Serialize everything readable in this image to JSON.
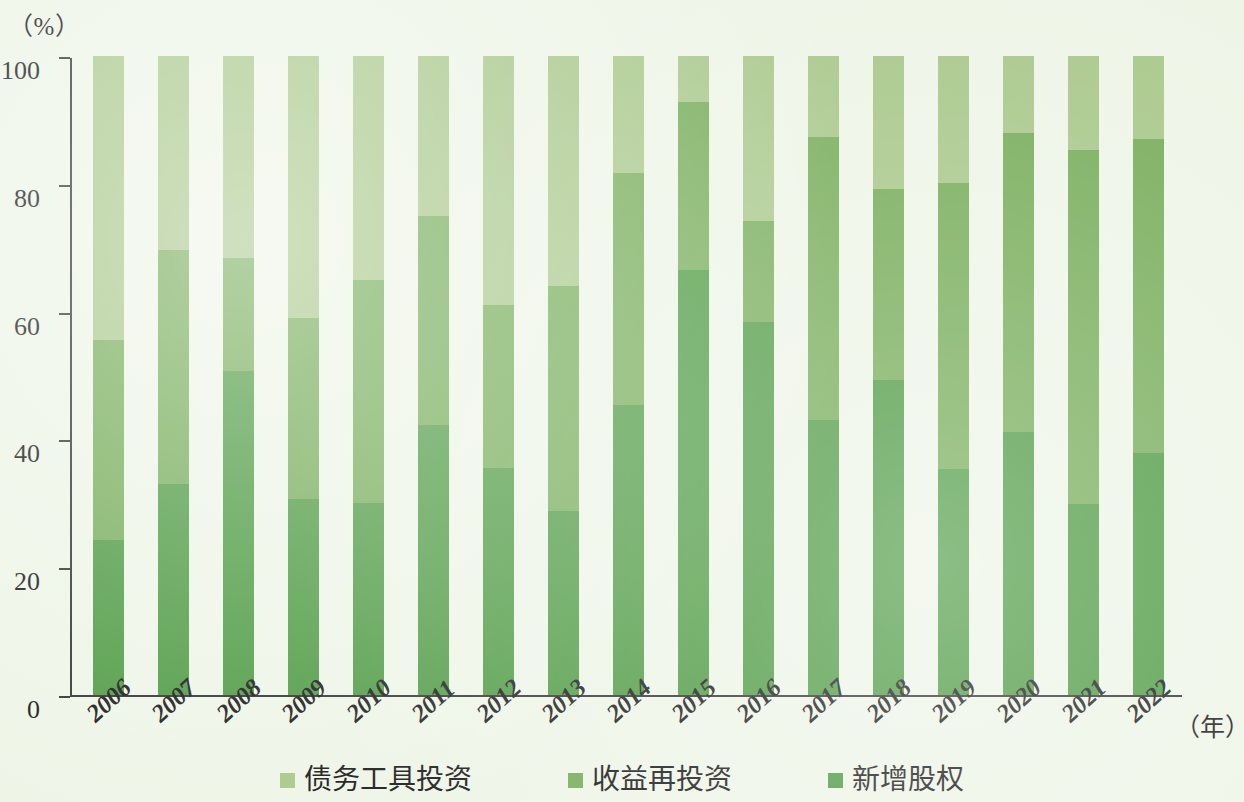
{
  "axes": {
    "y_unit": "（%）",
    "x_unit": "（年）",
    "y_ticks": [
      "0",
      "20",
      "40",
      "60",
      "80",
      "100"
    ]
  },
  "legend": {
    "items": [
      {
        "label": "债务工具投资",
        "color": "#a9c88b",
        "key": "debt"
      },
      {
        "label": "收益再投资",
        "color": "#77ad5a",
        "key": "reinvested"
      },
      {
        "label": "新增股权",
        "color": "#4f9b44",
        "key": "equity"
      }
    ]
  },
  "chart_data": {
    "type": "bar",
    "stacked": true,
    "stack_total": 100,
    "title": "",
    "subtitle": "",
    "xlabel": "（年）",
    "ylabel": "（%）",
    "ylim": [
      0,
      100
    ],
    "yticks": [
      0,
      20,
      40,
      60,
      80,
      100
    ],
    "grid": false,
    "legend_position": "bottom",
    "categories": [
      "2006",
      "2007",
      "2008",
      "2009",
      "2010",
      "2011",
      "2012",
      "2013",
      "2014",
      "2015",
      "2016",
      "2017",
      "2018",
      "2019",
      "2020",
      "2021",
      "2022"
    ],
    "series": [
      {
        "name": "新增股权",
        "color": "#4f9b44",
        "values": [
          24.3,
          33.0,
          50.7,
          30.6,
          30.1,
          42.2,
          35.6,
          28.8,
          45.4,
          66.5,
          58.4,
          43.0,
          49.3,
          35.3,
          41.1,
          29.9,
          37.8
        ]
      },
      {
        "name": "收益再投资",
        "color": "#77ad5a",
        "values": [
          31.3,
          36.7,
          17.7,
          28.4,
          34.8,
          32.7,
          25.4,
          35.2,
          36.3,
          26.3,
          15.8,
          44.4,
          29.9,
          44.8,
          46.8,
          55.4,
          49.2
        ]
      },
      {
        "name": "债务工具投资",
        "color": "#a9c88b",
        "values": [
          44.4,
          30.3,
          31.6,
          41.0,
          35.1,
          25.1,
          39.0,
          36.0,
          18.3,
          7.2,
          25.8,
          12.6,
          20.8,
          19.9,
          12.1,
          14.7,
          13.0
        ]
      }
    ],
    "cumulative_tops": {
      "新增股权": [
        24.3,
        33.0,
        50.7,
        30.6,
        30.1,
        42.2,
        35.6,
        28.8,
        45.4,
        66.5,
        58.4,
        43.0,
        49.3,
        35.3,
        41.1,
        29.9,
        37.8
      ],
      "收益再投资": [
        55.6,
        69.7,
        68.4,
        59.0,
        64.9,
        74.9,
        61.0,
        64.0,
        81.7,
        92.8,
        74.2,
        87.4,
        79.2,
        80.1,
        87.9,
        85.3,
        87.0
      ],
      "债务工具投资": [
        100,
        100,
        100,
        100,
        100,
        100,
        100,
        100,
        100,
        100,
        100,
        100,
        100,
        100,
        100,
        100,
        100
      ]
    }
  }
}
